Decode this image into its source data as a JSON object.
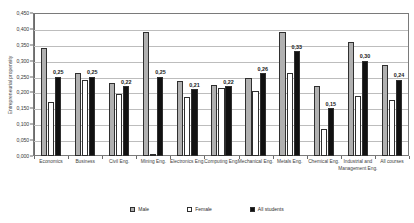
{
  "chart_data": {
    "type": "bar",
    "title": "",
    "xlabel": "",
    "ylabel": "Entrepreneurial propensity",
    "ylim": [
      0.0,
      0.45
    ],
    "ytick_labels": [
      "0,450",
      "0,400",
      "0,350",
      "0,300",
      "0,250",
      "0,200",
      "0,150",
      "0,100",
      "0,050",
      "0,000"
    ],
    "ytick_values": [
      0.45,
      0.4,
      0.35,
      0.3,
      0.25,
      0.2,
      0.15,
      0.1,
      0.05,
      0.0
    ],
    "grid": true,
    "legend_position": "bottom",
    "categories": [
      "Economics",
      "Business",
      "Civil Eng.",
      "Mining Eng.",
      "Electronics Eng.",
      "Computing Eng.",
      "Mechanical Eng.",
      "Metals Eng.",
      "Chemical Eng.",
      "Industrial and Management Eng.",
      "All courses"
    ],
    "series": [
      {
        "name": "Male",
        "color": "#b0b0b0",
        "values": [
          0.34,
          0.26,
          0.23,
          0.39,
          0.235,
          0.225,
          0.245,
          0.39,
          0.22,
          0.36,
          0.285
        ]
      },
      {
        "name": "Female",
        "color": "#ffffff",
        "values": [
          0.17,
          0.24,
          0.195,
          0.005,
          0.185,
          0.215,
          0.205,
          0.26,
          0.085,
          0.19,
          0.175
        ]
      },
      {
        "name": "All students",
        "color": "#111111",
        "values": [
          0.25,
          0.25,
          0.22,
          0.25,
          0.21,
          0.22,
          0.26,
          0.33,
          0.15,
          0.3,
          0.24
        ]
      }
    ],
    "data_labels": [
      "0,25",
      "0,25",
      "0,22",
      "0,25",
      "0,21",
      "0,22",
      "0,26",
      "0,33",
      "0,15",
      "0,30",
      "0,24"
    ]
  }
}
